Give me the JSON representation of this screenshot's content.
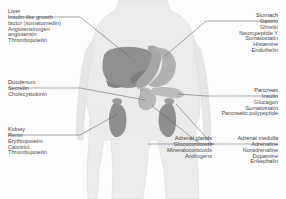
{
  "figure": {
    "body_fill": "#ebebeb",
    "body_stroke": "#d8d8d8",
    "organ_liver_color": "#8c8c8c",
    "organ_stomach_color": "#a8a8a8",
    "organ_pancreas_color": "#b4b4b4",
    "organ_kidney_color": "#929292",
    "leader_color": "#5a5a5a",
    "text_color": "#3a3a3a"
  },
  "callouts": {
    "liver": {
      "organ": "Liver",
      "hormones": [
        "Insulin-like growth",
        "factor (somatomedin)",
        "Angiotensinogen",
        "angiotensin",
        "Thrombopoietin"
      ]
    },
    "duodenum": {
      "organ": "Duodenum",
      "hormones": [
        "Secretin",
        "Cholecystokinin"
      ]
    },
    "kidney": {
      "organ": "Kidney",
      "hormones": [
        "Renin",
        "Erythropoietin",
        "Calcitriol",
        "Thrombopoietin"
      ]
    },
    "stomach": {
      "organ": "Stomach",
      "hormones": [
        "Gastrin",
        "Ghrelin",
        "Neuropeptide Y",
        "Somatostatin",
        "Histamine",
        "Endothelin"
      ]
    },
    "pancreas": {
      "organ": "Pancreas",
      "hormones": [
        "Insulin",
        "Glucagon",
        "Somatostatin",
        "Pancreatic polypeptide"
      ]
    },
    "adrenal_glands": {
      "organ": "Adrenal glands",
      "hormones": [
        "Glucocorticoids",
        "Mineralocorticoids",
        "Androgens"
      ]
    },
    "adrenal_medulla": {
      "organ": "Adrenal medulla",
      "hormones": [
        "Adrenaline",
        "Noradrenaline",
        "Dopamine",
        "Enkephalin"
      ]
    }
  }
}
